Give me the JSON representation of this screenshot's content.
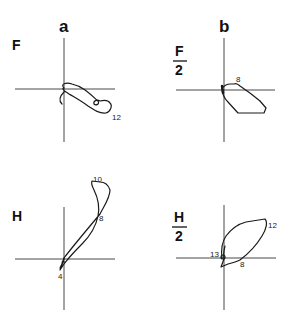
{
  "columns": [
    {
      "id": "a",
      "label": "a"
    },
    {
      "id": "b",
      "label": "b"
    }
  ],
  "panels": [
    {
      "id": "F-a",
      "row_label": {
        "numerator": "F",
        "denominator": null
      },
      "column": "a",
      "point_labels": [
        {
          "text": "12"
        }
      ]
    },
    {
      "id": "F2-b",
      "row_label": {
        "numerator": "F",
        "denominator": "2"
      },
      "column": "b",
      "point_labels": [
        {
          "text": "8"
        }
      ]
    },
    {
      "id": "H-a",
      "row_label": {
        "numerator": "H",
        "denominator": null
      },
      "column": "a",
      "point_labels": [
        {
          "text": "10"
        },
        {
          "text": "8"
        },
        {
          "text": "4"
        }
      ]
    },
    {
      "id": "H2-b",
      "row_label": {
        "numerator": "H",
        "denominator": "2"
      },
      "column": "b",
      "point_labels": [
        {
          "text": "12"
        },
        {
          "text": "13"
        },
        {
          "text": "8"
        }
      ]
    }
  ]
}
